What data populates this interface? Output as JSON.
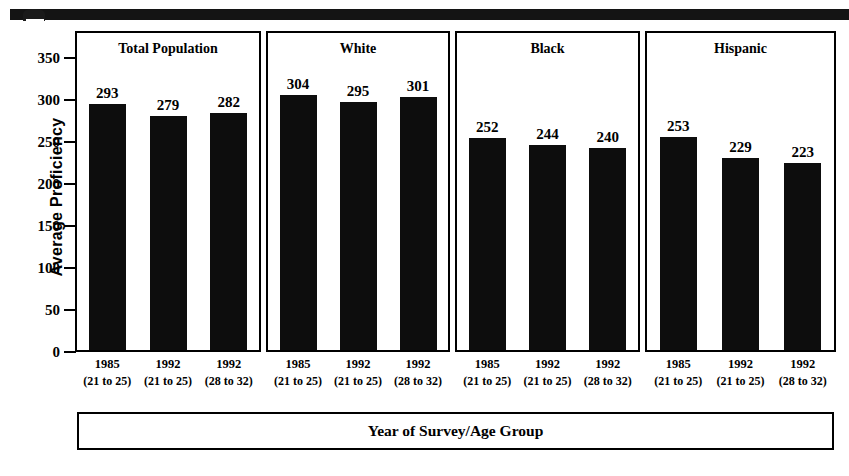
{
  "figure": {
    "top_rule": "decorative-rule",
    "y_axis_title": "Average Proficiency",
    "x_axis_title": "Year of Survey/Age Group"
  },
  "chart_data": {
    "type": "bar",
    "title": "",
    "xlabel": "Year of Survey/Age Group",
    "ylabel": "Average Proficiency",
    "ylim": [
      0,
      350
    ],
    "yticks": [
      0,
      50,
      100,
      150,
      200,
      250,
      300,
      350
    ],
    "ytick_labels": [
      "0",
      "50",
      "100",
      "150",
      "200",
      "250",
      "300",
      "350"
    ],
    "grid": false,
    "legend": "none",
    "panels": [
      {
        "name": "Total Population",
        "categories": [
          "1985",
          "1992",
          "1992"
        ],
        "age_groups": [
          "(21 to 25)",
          "(21 to 25)",
          "(28 to 32)"
        ],
        "values": [
          293,
          279,
          282
        ]
      },
      {
        "name": "White",
        "categories": [
          "1985",
          "1992",
          "1992"
        ],
        "age_groups": [
          "(21 to 25)",
          "(21 to 25)",
          "(28 to 32)"
        ],
        "values": [
          304,
          295,
          301
        ]
      },
      {
        "name": "Black",
        "categories": [
          "1985",
          "1992",
          "1992"
        ],
        "age_groups": [
          "(21 to 25)",
          "(21 to 25)",
          "(28 to 32)"
        ],
        "values": [
          252,
          244,
          240
        ]
      },
      {
        "name": "Hispanic",
        "categories": [
          "1985",
          "1992",
          "1992"
        ],
        "age_groups": [
          "(21 to 25)",
          "(21 to 25)",
          "(28 to 32)"
        ],
        "values": [
          253,
          229,
          223
        ]
      }
    ],
    "bar_color": "#0d0d0d",
    "background_color": "#ffffff"
  }
}
